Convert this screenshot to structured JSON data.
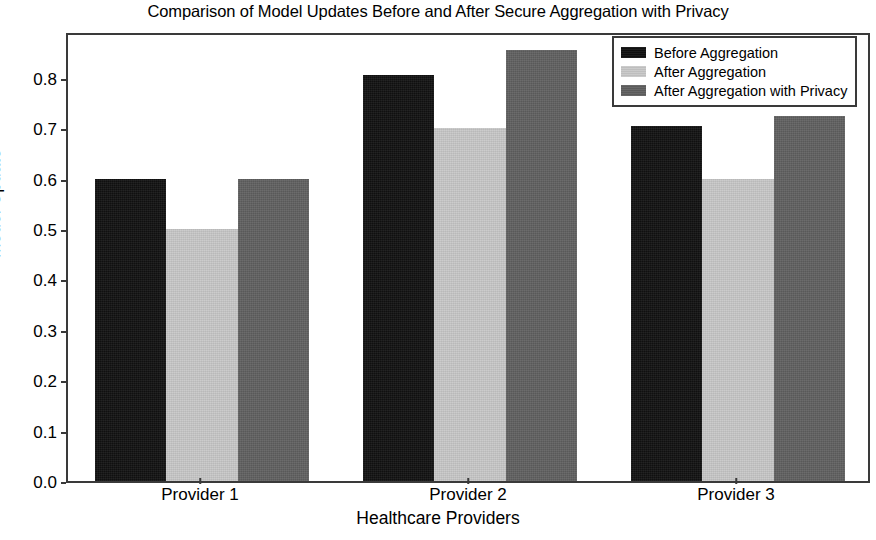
{
  "chart_data": {
    "type": "bar",
    "title": "Comparison of Model Updates Before and After Secure Aggregation with Privacy",
    "xlabel": "Healthcare Providers",
    "ylabel": "Model Update",
    "categories": [
      "Provider 1",
      "Provider 2",
      "Provider 3"
    ],
    "series": [
      {
        "name": "Before Aggregation",
        "color": "#111111",
        "values": [
          0.6,
          0.805,
          0.705
        ]
      },
      {
        "name": "After Aggregation",
        "color": "#c8c8c8",
        "values": [
          0.5,
          0.7,
          0.6
        ]
      },
      {
        "name": "After Aggregation with Privacy",
        "color": "#606060",
        "values": [
          0.6,
          0.855,
          0.725
        ]
      }
    ],
    "ylim": [
      0.0,
      0.893
    ],
    "yticks": [
      0.0,
      0.1,
      0.2,
      0.3,
      0.4,
      0.5,
      0.6,
      0.7,
      0.8
    ],
    "ytick_labels": [
      "0.0",
      "0.1",
      "0.2",
      "0.3",
      "0.4",
      "0.5",
      "0.6",
      "0.7",
      "0.8"
    ],
    "grid": false,
    "legend_position": "upper right",
    "bar_group_gap": 0.2
  }
}
